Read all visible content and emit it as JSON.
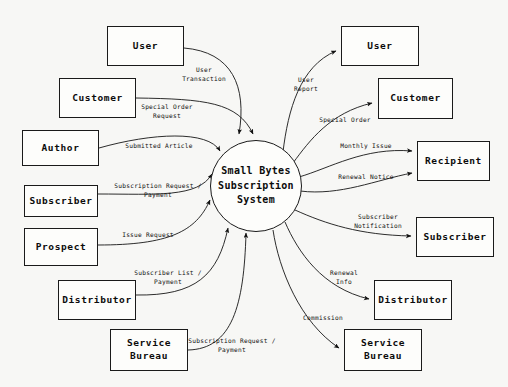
{
  "diagram": {
    "process": {
      "label": "Small Bytes\nSubscription\nSystem",
      "cx": 256,
      "cy": 186,
      "r": 46
    },
    "colors": {
      "background": "#f7f7f5",
      "stroke": "#1a1a1a",
      "box_fill": "#fdfdfb",
      "text": "#0c0c0c"
    },
    "external_entities": [
      {
        "id": "user-left",
        "label": "User",
        "x": 107,
        "y": 26,
        "w": 77,
        "h": 40
      },
      {
        "id": "customer-left",
        "label": "Customer",
        "x": 59,
        "y": 78,
        "w": 77,
        "h": 40
      },
      {
        "id": "author-left",
        "label": "Author",
        "x": 22,
        "y": 130,
        "w": 77,
        "h": 36
      },
      {
        "id": "subscriber-left",
        "label": "Subscriber",
        "x": 24,
        "y": 185,
        "w": 74,
        "h": 32
      },
      {
        "id": "prospect-left",
        "label": "Prospect",
        "x": 24,
        "y": 228,
        "w": 74,
        "h": 38
      },
      {
        "id": "distributor-left",
        "label": "Distributor",
        "x": 58,
        "y": 280,
        "w": 78,
        "h": 40
      },
      {
        "id": "service-bureau-left",
        "label": "Service\nBureau",
        "x": 110,
        "y": 329,
        "w": 78,
        "h": 42
      },
      {
        "id": "user-right",
        "label": "User",
        "x": 341,
        "y": 26,
        "w": 78,
        "h": 40
      },
      {
        "id": "customer-right",
        "label": "Customer",
        "x": 378,
        "y": 78,
        "w": 75,
        "h": 41
      },
      {
        "id": "recipient-right",
        "label": "Recipient",
        "x": 417,
        "y": 141,
        "w": 73,
        "h": 40
      },
      {
        "id": "subscriber-right",
        "label": "Subscriber",
        "x": 416,
        "y": 217,
        "w": 78,
        "h": 40
      },
      {
        "id": "distributor-right",
        "label": "Distributor",
        "x": 374,
        "y": 280,
        "w": 78,
        "h": 40
      },
      {
        "id": "service-bureau-right",
        "label": "Service\nBureau",
        "x": 344,
        "y": 329,
        "w": 78,
        "h": 42
      }
    ],
    "data_flows": [
      {
        "id": "user-transaction",
        "label": "User\nTransaction",
        "direction": "inbound",
        "from": "user-left",
        "to": "process",
        "label_x": 204,
        "label_y": 74
      },
      {
        "id": "special-order-request",
        "label": "Special Order\nRequest",
        "direction": "inbound",
        "from": "customer-left",
        "to": "process",
        "label_x": 167,
        "label_y": 111
      },
      {
        "id": "submitted-article",
        "label": "Submitted Article",
        "direction": "inbound",
        "from": "author-left",
        "to": "process",
        "label_x": 159,
        "label_y": 146
      },
      {
        "id": "subscription-request-sub",
        "label": "Subscription Request /\nPayment",
        "direction": "inbound",
        "from": "subscriber-left",
        "to": "process",
        "label_x": 158,
        "label_y": 190
      },
      {
        "id": "issue-request",
        "label": "Issue Request",
        "direction": "inbound",
        "from": "prospect-left",
        "to": "process",
        "label_x": 148,
        "label_y": 235
      },
      {
        "id": "subscriber-list-payment",
        "label": "Subscriber List /\nPayment",
        "direction": "inbound",
        "from": "distributor-left",
        "to": "process",
        "label_x": 168,
        "label_y": 277
      },
      {
        "id": "subscription-request-sb",
        "label": "Subscription Request /\nPayment",
        "direction": "inbound",
        "from": "service-bureau-left",
        "to": "process",
        "label_x": 232,
        "label_y": 345
      },
      {
        "id": "user-report",
        "label": "User\nReport",
        "direction": "outbound",
        "from": "process",
        "to": "user-right",
        "label_x": 306,
        "label_y": 84
      },
      {
        "id": "special-order",
        "label": "Special Order",
        "direction": "outbound",
        "from": "process",
        "to": "customer-right",
        "label_x": 345,
        "label_y": 120
      },
      {
        "id": "monthly-issue",
        "label": "Monthly Issue",
        "direction": "outbound",
        "from": "process",
        "to": "recipient-right",
        "label_x": 366,
        "label_y": 146
      },
      {
        "id": "renewal-notice",
        "label": "Renewal Notice",
        "direction": "outbound",
        "from": "process",
        "to": "recipient-right",
        "label_x": 366,
        "label_y": 177
      },
      {
        "id": "subscriber-notification",
        "label": "Subscriber\nNotification",
        "direction": "outbound",
        "from": "process",
        "to": "subscriber-right",
        "label_x": 378,
        "label_y": 221
      },
      {
        "id": "renewal-info",
        "label": "Renewal\nInfo",
        "direction": "outbound",
        "from": "process",
        "to": "distributor-right",
        "label_x": 344,
        "label_y": 277
      },
      {
        "id": "commission",
        "label": "Commission",
        "direction": "outbound",
        "from": "process",
        "to": "service-bureau-right",
        "label_x": 323,
        "label_y": 318
      }
    ]
  }
}
